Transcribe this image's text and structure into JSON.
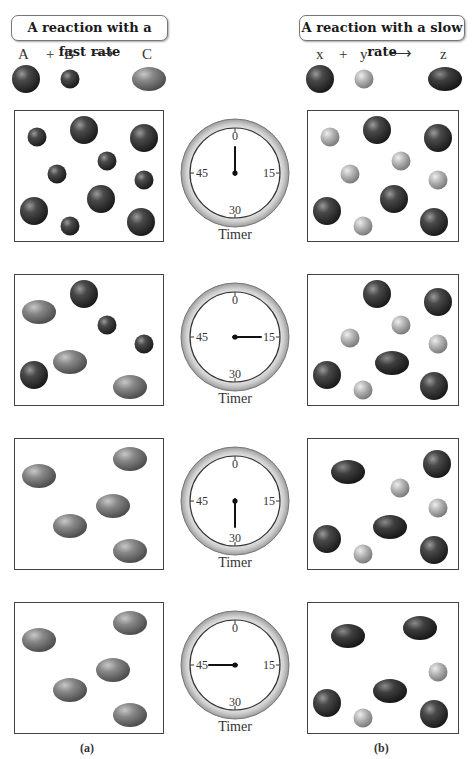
{
  "titles": {
    "fast": "A reaction with a fast rate",
    "slow": "A reaction with a slow rate"
  },
  "equations": {
    "fast": {
      "reactant1": "A",
      "plus": "+",
      "reactant2": "B",
      "arrow": "⟶",
      "product": "C"
    },
    "slow": {
      "reactant1": "x",
      "plus": "+",
      "reactant2": "y",
      "arrow": "⟶",
      "product": "z"
    }
  },
  "colors": {
    "dark_sphere": "#2e2e2e",
    "light_sphere": "#b8b8b8",
    "gray_ellipse": "#7a7a7a",
    "dark_ellipse": "#333333",
    "border": "#444444"
  },
  "timer": {
    "label": "Timer",
    "ticks": [
      "0",
      "15",
      "30",
      "45"
    ]
  },
  "captions": {
    "a": "(a)",
    "b": "(b)"
  },
  "rows": [
    {
      "timer_seconds": 0,
      "fast": [
        {
          "t": "sA",
          "x": 22,
          "y": 26
        },
        {
          "t": "sA",
          "x": 92,
          "y": 50
        },
        {
          "t": "sA",
          "x": 42,
          "y": 63
        },
        {
          "t": "sA",
          "x": 129,
          "y": 69
        },
        {
          "t": "sA",
          "x": 55,
          "y": 115
        },
        {
          "t": "bA",
          "x": 69,
          "y": 19
        },
        {
          "t": "bA",
          "x": 129,
          "y": 27
        },
        {
          "t": "bA",
          "x": 19,
          "y": 100
        },
        {
          "t": "bA",
          "x": 86,
          "y": 88
        },
        {
          "t": "bA",
          "x": 126,
          "y": 111
        }
      ],
      "slow": [
        {
          "t": "sY",
          "x": 22,
          "y": 26
        },
        {
          "t": "sY",
          "x": 93,
          "y": 50
        },
        {
          "t": "sY",
          "x": 42,
          "y": 63
        },
        {
          "t": "sY",
          "x": 130,
          "y": 69
        },
        {
          "t": "sY",
          "x": 55,
          "y": 115
        },
        {
          "t": "bX",
          "x": 69,
          "y": 19
        },
        {
          "t": "bX",
          "x": 130,
          "y": 27
        },
        {
          "t": "bX",
          "x": 19,
          "y": 100
        },
        {
          "t": "bX",
          "x": 86,
          "y": 88
        },
        {
          "t": "bX",
          "x": 126,
          "y": 111
        }
      ]
    },
    {
      "timer_seconds": 15,
      "fast": [
        {
          "t": "eC",
          "x": 24,
          "y": 37
        },
        {
          "t": "eC",
          "x": 55,
          "y": 87
        },
        {
          "t": "eC",
          "x": 115,
          "y": 112
        },
        {
          "t": "bA",
          "x": 69,
          "y": 19
        },
        {
          "t": "bA",
          "x": 19,
          "y": 100
        },
        {
          "t": "sA",
          "x": 92,
          "y": 50
        },
        {
          "t": "sA",
          "x": 129,
          "y": 69
        }
      ],
      "slow": [
        {
          "t": "bX",
          "x": 69,
          "y": 19
        },
        {
          "t": "bX",
          "x": 130,
          "y": 27
        },
        {
          "t": "bX",
          "x": 19,
          "y": 100
        },
        {
          "t": "bX",
          "x": 126,
          "y": 111
        },
        {
          "t": "sY",
          "x": 93,
          "y": 50
        },
        {
          "t": "sY",
          "x": 42,
          "y": 63
        },
        {
          "t": "sY",
          "x": 130,
          "y": 69
        },
        {
          "t": "sY",
          "x": 55,
          "y": 115
        },
        {
          "t": "eZ",
          "x": 84,
          "y": 88
        }
      ]
    },
    {
      "timer_seconds": 30,
      "fast": [
        {
          "t": "eC",
          "x": 24,
          "y": 37
        },
        {
          "t": "eC",
          "x": 55,
          "y": 87
        },
        {
          "t": "eC",
          "x": 98,
          "y": 67
        },
        {
          "t": "eC",
          "x": 115,
          "y": 20
        },
        {
          "t": "eC",
          "x": 115,
          "y": 112
        }
      ],
      "slow": [
        {
          "t": "eZ",
          "x": 40,
          "y": 33
        },
        {
          "t": "eZ",
          "x": 82,
          "y": 88
        },
        {
          "t": "bX",
          "x": 129,
          "y": 25
        },
        {
          "t": "bX",
          "x": 19,
          "y": 100
        },
        {
          "t": "bX",
          "x": 126,
          "y": 111
        },
        {
          "t": "sY",
          "x": 92,
          "y": 49
        },
        {
          "t": "sY",
          "x": 130,
          "y": 69
        },
        {
          "t": "sY",
          "x": 55,
          "y": 115
        }
      ]
    },
    {
      "timer_seconds": 45,
      "fast": [
        {
          "t": "eC",
          "x": 24,
          "y": 37
        },
        {
          "t": "eC",
          "x": 55,
          "y": 87
        },
        {
          "t": "eC",
          "x": 98,
          "y": 67
        },
        {
          "t": "eC",
          "x": 115,
          "y": 20
        },
        {
          "t": "eC",
          "x": 115,
          "y": 112
        }
      ],
      "slow": [
        {
          "t": "eZ",
          "x": 40,
          "y": 33
        },
        {
          "t": "eZ",
          "x": 112,
          "y": 25
        },
        {
          "t": "eZ",
          "x": 82,
          "y": 88
        },
        {
          "t": "bX",
          "x": 19,
          "y": 100
        },
        {
          "t": "bX",
          "x": 126,
          "y": 111
        },
        {
          "t": "sY",
          "x": 130,
          "y": 69
        },
        {
          "t": "sY",
          "x": 55,
          "y": 115
        }
      ]
    }
  ]
}
